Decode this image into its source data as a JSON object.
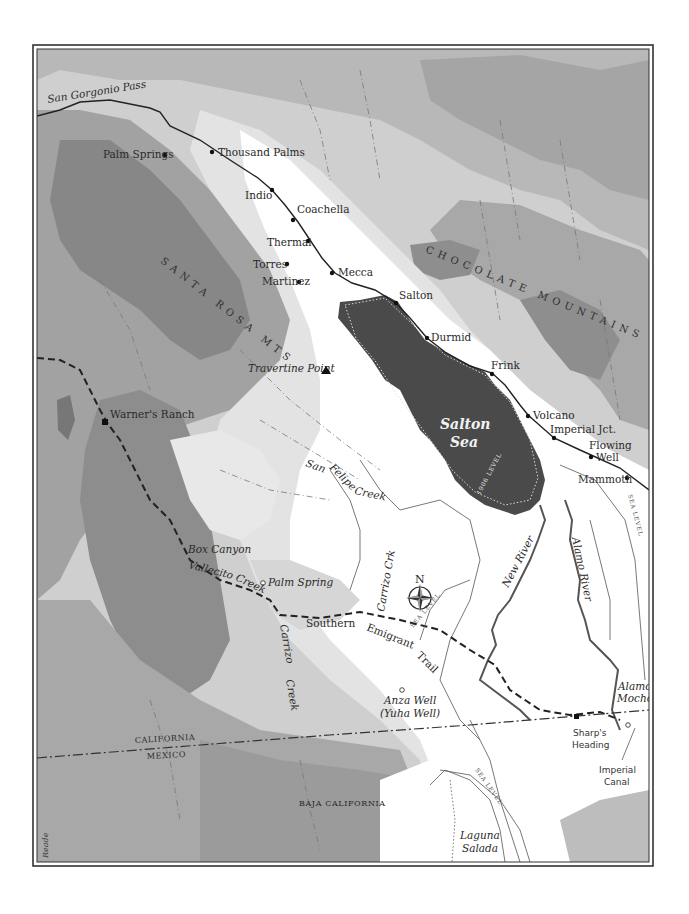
{
  "map": {
    "frame": {
      "outer": [
        33,
        45,
        620,
        821
      ],
      "inner": [
        37,
        49,
        612,
        813
      ]
    },
    "colors": {
      "lowland": "#ffffff",
      "elev1": "#e6e6e6",
      "elev2": "#cfcfcf",
      "elev3": "#b2b2b2",
      "elev4": "#8e8e8e",
      "water": "#4a4a4a",
      "ink": "#2a2a2a",
      "frame": "#333333"
    },
    "regions": {
      "san_gorgonio_pass": "San Gorgonio Pass",
      "chocolate_mountains": "CHOCOLATE MOUNTAINS",
      "santa_rosa_mts": "SANTA ROSA MTS",
      "california": "CALIFORNIA",
      "mexico": "MEXICO",
      "baja_california": "BAJA CALIFORNIA"
    },
    "towns": [
      {
        "name": "Palm Springs",
        "x": 165,
        "y": 154,
        "marker": "dot"
      },
      {
        "name": "Thousand Palms",
        "x": 212,
        "y": 152,
        "marker": "dot"
      },
      {
        "name": "Indio",
        "x": 272,
        "y": 190,
        "marker": "dot"
      },
      {
        "name": "Coachella",
        "x": 293,
        "y": 220,
        "marker": "dot"
      },
      {
        "name": "Thermal",
        "x": 308,
        "y": 240,
        "marker": "dot"
      },
      {
        "name": "Torres",
        "x": 287,
        "y": 263,
        "marker": "dot"
      },
      {
        "name": "Martinez",
        "x": 298,
        "y": 281,
        "marker": "dot"
      },
      {
        "name": "Mecca",
        "x": 332,
        "y": 273,
        "marker": "dot"
      },
      {
        "name": "Salton",
        "x": 396,
        "y": 303,
        "marker": "dot"
      },
      {
        "name": "Durmid",
        "x": 427,
        "y": 338,
        "marker": "dot"
      },
      {
        "name": "Frink",
        "x": 492,
        "y": 373,
        "marker": "dot"
      },
      {
        "name": "Volcano",
        "x": 528,
        "y": 415,
        "marker": "dot"
      },
      {
        "name": "Imperial Jct.",
        "x": 554,
        "y": 438,
        "marker": "dot"
      },
      {
        "name": "Flowing",
        "x": 620,
        "y": 456,
        "marker": "dot"
      },
      {
        "name": "Well",
        "x": 620,
        "y": 456,
        "marker": "none"
      },
      {
        "name": "Mammoth",
        "x": 628,
        "y": 478,
        "marker": "dot"
      }
    ],
    "places": {
      "travertine_point": "Travertine Point",
      "warners_ranch": "Warner's Ranch",
      "box_canyon": "Box Canyon",
      "palm_spring": "Palm Spring",
      "anza_well": "Anza Well",
      "yuha_well": "(Yuha Well)",
      "alamo_mocho_1": "Alamo",
      "alamo_mocho_2": "Mocho",
      "sharps_heading_1": "Sharp's",
      "sharps_heading_2": "Heading",
      "imperial_canal_1": "Imperial",
      "imperial_canal_2": "Canal"
    },
    "water": {
      "salton_sea_1": "Salton",
      "salton_sea_2": "Sea",
      "level_1906": "1906 LEVEL",
      "new_river": "New River",
      "alamo_river": "Alamo River",
      "san_felipe_creek_1": "San",
      "san_felipe_creek_2": "Felipe",
      "san_felipe_creek_3": "Creek",
      "carrizo_crk": "Carrizo Crk",
      "carrizo_creek_1": "Carrizo",
      "carrizo_creek_2": "Creek",
      "vallecito_creek_1": "Vallecito",
      "vallecito_creek_2": "Creek",
      "laguna_salada_1": "Laguna",
      "laguna_salada_2": "Salada",
      "sea_level": "SEA LEVEL"
    },
    "trail": {
      "southern": "Southern",
      "emigrant": "Emigrant",
      "trail": "Trail"
    },
    "compass": {
      "north": "N",
      "x": 420,
      "y": 598
    },
    "credit": "Reade"
  }
}
